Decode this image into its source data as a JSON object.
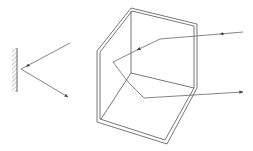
{
  "figure": {
    "colors": {
      "line": "#555555",
      "ray": "#666666",
      "background": "#ffffff"
    },
    "plane_mirror": {
      "surface": {
        "x": 17,
        "y1": 48,
        "y2": 92,
        "hatching": "left"
      },
      "incident_ray": {
        "from": [
          70,
          43
        ],
        "to": [
          21,
          69
        ],
        "arrow": "near-end"
      },
      "reflected_ray": {
        "from": [
          21,
          69
        ],
        "to": [
          68,
          97
        ],
        "arrow": "end"
      }
    },
    "corner_reflector": {
      "outer_outline": [
        [
          97,
          51
        ],
        [
          131,
          8
        ],
        [
          197,
          24
        ],
        [
          197,
          88
        ],
        [
          167,
          144
        ],
        [
          97,
          122
        ]
      ],
      "inner_edges": [
        [
          [
            131,
            8
          ],
          [
            131,
            73
          ]
        ],
        [
          [
            131,
            73
          ],
          [
            197,
            88
          ]
        ],
        [
          [
            131,
            73
          ],
          [
            100,
            120
          ]
        ]
      ],
      "ray_path": [
        [
          243,
          32
        ],
        [
          160,
          39
        ],
        [
          113,
          62
        ],
        [
          128,
          82
        ],
        [
          144,
          98
        ],
        [
          243,
          92
        ]
      ],
      "ray_arrows": [
        "incoming",
        "mid-incoming",
        "mid-return",
        "outgoing"
      ]
    }
  }
}
